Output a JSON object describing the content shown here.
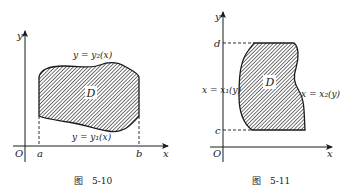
{
  "figures": [
    {
      "id": "fig-5-10",
      "caption_prefix": "图",
      "caption_number": "5-10",
      "axes": {
        "x_label": "x",
        "y_label": "y",
        "origin_label": "O"
      },
      "region_label": "D",
      "x_bounds": [
        "a",
        "b"
      ],
      "upper_curve_label": "y = y₂(x)",
      "lower_curve_label": "y = y₁(x)"
    },
    {
      "id": "fig-5-11",
      "caption_prefix": "图",
      "caption_number": "5-11",
      "axes": {
        "x_label": "x",
        "y_label": "y",
        "origin_label": "O"
      },
      "region_label": "D",
      "y_bounds": [
        "c",
        "d"
      ],
      "left_curve_label": "x = x₁(y)",
      "right_curve_label": "x = x₂(y)"
    }
  ],
  "colors": {
    "ink": "#1a1a1a",
    "hatch": "#333333",
    "background": "#ffffff"
  }
}
